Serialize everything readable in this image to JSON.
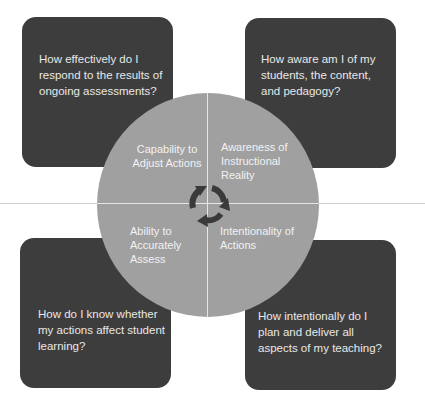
{
  "diagram": {
    "type": "quadrant-cycle",
    "center_icon": "cycle-arrows-icon",
    "colors": {
      "background": "#ffffff",
      "question_box": "#3d3d3d",
      "question_text": "#e8e8e8",
      "circle_fill": "#a0a0a0",
      "circle_text": "#f2f2f2",
      "cycle_arrows": "#3a3a3a",
      "divider": "#e6e6e6",
      "horizontal_rule": "#d0d0d0"
    },
    "quadrants": [
      {
        "position": "top-left",
        "label": "Capability to Adjust Actions",
        "question": "How effectively do I respond to the results of ongoing assessments?"
      },
      {
        "position": "top-right",
        "label": "Awareness of Instructional Reality",
        "question": "How aware am I of my students, the content, and pedagogy?"
      },
      {
        "position": "bottom-left",
        "label": "Ability to Accurately Assess",
        "question": "How do I know whether my actions affect student learning?"
      },
      {
        "position": "bottom-right",
        "label": "Intentionality of Actions",
        "question": "How intentionally do I plan and deliver all aspects of my teaching?"
      }
    ]
  }
}
